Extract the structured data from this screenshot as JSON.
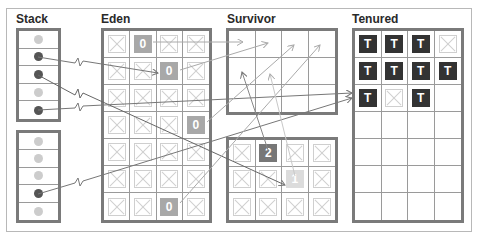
{
  "colors": {
    "frame": "#b8b8b8",
    "box_border": "#7a7a7a",
    "dot_live": "#555555",
    "dot_dead": "#cccccc",
    "obj_age0": "#a8a8a8",
    "obj_age1": "#dcdcdc",
    "obj_age2": "#777777",
    "obj_tenured": "#333333",
    "line": "#777777",
    "line_light": "#b0b0b0"
  },
  "stack": {
    "title": "Stack",
    "frames": [
      {
        "slots": [
          "dead",
          "live",
          "live",
          "dead",
          "live"
        ]
      },
      {
        "slots": [
          "dead",
          "dead",
          "dead",
          "live",
          "dead"
        ]
      }
    ]
  },
  "eden": {
    "title": "Eden",
    "cols": 4,
    "rows": 7,
    "cells": [
      [
        "x",
        "0",
        "x",
        "x"
      ],
      [
        "x",
        "x",
        "0",
        "x"
      ],
      [
        "x",
        "x",
        "x",
        "x"
      ],
      [
        "x",
        "x",
        "x",
        "0"
      ],
      [
        "x",
        "x",
        "x",
        "x"
      ],
      [
        "x",
        "x",
        "x",
        "x"
      ],
      [
        "x",
        "x",
        "0",
        "x"
      ]
    ]
  },
  "survivor": {
    "title": "Survivor",
    "spaces": [
      {
        "name": "survivor-from",
        "cols": 4,
        "rows": 3,
        "cells": [
          [
            "",
            "",
            "",
            ""
          ],
          [
            "",
            "",
            "",
            ""
          ],
          [
            "",
            "",
            "",
            ""
          ]
        ]
      },
      {
        "name": "survivor-to",
        "cols": 4,
        "rows": 3,
        "cells": [
          [
            "x",
            "2",
            "x",
            "x"
          ],
          [
            "x",
            "x",
            "1",
            "x"
          ],
          [
            "x",
            "x",
            "x",
            "x"
          ]
        ]
      }
    ]
  },
  "tenured": {
    "title": "Tenured",
    "cols": 4,
    "rows": 7,
    "cells": [
      [
        "T",
        "T",
        "T",
        "x"
      ],
      [
        "T",
        "T",
        "T",
        "T"
      ],
      [
        "T",
        "x",
        "T",
        ""
      ],
      [
        "",
        "",
        "",
        ""
      ],
      [
        "",
        "",
        "",
        ""
      ],
      [
        "",
        "",
        "",
        ""
      ],
      [
        "",
        "",
        "",
        ""
      ]
    ]
  }
}
